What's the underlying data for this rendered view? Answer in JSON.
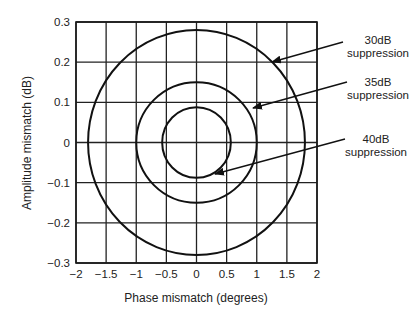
{
  "chart_data": {
    "type": "line",
    "title": "",
    "xlabel": "Phase mismatch (degrees)",
    "ylabel": "Amplitude mismatch (dB)",
    "xlim": [
      -2,
      2
    ],
    "ylim": [
      -0.3,
      0.3
    ],
    "xticks": [
      -2,
      -1.5,
      -1,
      -0.5,
      0,
      0.5,
      1,
      1.5,
      2
    ],
    "xtick_labels": [
      "−2",
      "−1.5",
      "−1",
      "−0.5",
      "0",
      "0.5",
      "1",
      "1.5",
      "2"
    ],
    "yticks": [
      0.3,
      0.2,
      0.1,
      0,
      -0.1,
      -0.2,
      -0.3
    ],
    "ytick_labels": [
      "0.3",
      "0.2",
      "0.1",
      "0",
      "−0.1",
      "−0.2",
      "−0.3"
    ],
    "grid": true,
    "legend": "none",
    "series": [
      {
        "name": "30dB suppression",
        "shape": "closed contour",
        "center": [
          0,
          0
        ],
        "x_half_width": 1.8,
        "y_half_height": 0.28
      },
      {
        "name": "35dB suppression",
        "shape": "closed contour",
        "center": [
          0,
          0
        ],
        "x_half_width": 1.0,
        "y_half_height": 0.15
      },
      {
        "name": "40dB suppression",
        "shape": "closed contour",
        "center": [
          0,
          0
        ],
        "x_half_width": 0.57,
        "y_half_height": 0.088
      }
    ],
    "annotations": [
      {
        "line1": "30dB",
        "line2": "suppression",
        "points_to": "30dB suppression"
      },
      {
        "line1": "35dB",
        "line2": "suppression",
        "points_to": "35dB suppression"
      },
      {
        "line1": "40dB",
        "line2": "suppression",
        "points_to": "40dB suppression"
      }
    ]
  },
  "plot": {
    "left": 76,
    "top": 22,
    "width": 241,
    "height": 241,
    "line_color": "#111111",
    "grid_color": "#222222"
  }
}
